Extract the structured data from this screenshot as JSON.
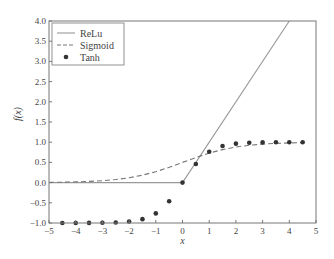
{
  "chart_data": {
    "type": "line",
    "title": "",
    "xlabel": "x",
    "ylabel": "f(x)",
    "xlim": [
      -5,
      5
    ],
    "ylim": [
      -1.0,
      4.0
    ],
    "x_ticks": [
      -5,
      -4,
      -3,
      -2,
      -1,
      0,
      1,
      2,
      3,
      4,
      5
    ],
    "x_tick_labels": [
      "−5",
      "−4",
      "−3",
      "−2",
      "−1",
      "0",
      "1",
      "2",
      "3",
      "4",
      "5"
    ],
    "y_ticks": [
      -1.0,
      -0.5,
      0.0,
      0.5,
      1.0,
      1.5,
      2.0,
      2.5,
      3.0,
      3.5,
      4.0
    ],
    "y_tick_labels": [
      "−1.0",
      "−0.5",
      "0.0",
      "0.5",
      "1.0",
      "1.5",
      "2.0",
      "2.5",
      "3.0",
      "3.5",
      "4.0"
    ],
    "grid": false,
    "legend_position": "top-left",
    "series": [
      {
        "name": "ReLu",
        "style": "solid-line",
        "color": "#999999",
        "x": [
          -5,
          0,
          4
        ],
        "y": [
          0,
          0,
          4
        ]
      },
      {
        "name": "Sigmoid",
        "style": "dashed-line",
        "color": "#777777",
        "x": [
          -5,
          -4.5,
          -4,
          -3.5,
          -3,
          -2.5,
          -2,
          -1.5,
          -1,
          -0.5,
          0,
          0.5,
          1,
          1.5,
          2,
          2.5,
          3,
          3.5,
          4,
          4.5
        ],
        "y": [
          0.007,
          0.011,
          0.018,
          0.029,
          0.047,
          0.076,
          0.119,
          0.182,
          0.269,
          0.378,
          0.5,
          0.622,
          0.731,
          0.818,
          0.881,
          0.924,
          0.953,
          0.971,
          0.982,
          0.989
        ]
      },
      {
        "name": "Tanh",
        "style": "dots",
        "color": "#333333",
        "x": [
          -4.5,
          -4,
          -3.5,
          -3,
          -2.5,
          -2,
          -1.5,
          -1,
          -0.5,
          0,
          0.5,
          1,
          1.5,
          2,
          2.5,
          3,
          3.5,
          4,
          4.5
        ],
        "y": [
          -1.0,
          -0.999,
          -0.998,
          -0.995,
          -0.987,
          -0.964,
          -0.905,
          -0.762,
          -0.462,
          0.0,
          0.462,
          0.762,
          0.905,
          0.964,
          0.987,
          0.995,
          0.998,
          0.999,
          1.0
        ]
      }
    ]
  }
}
